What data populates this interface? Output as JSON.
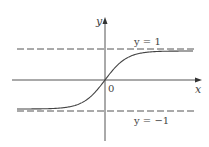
{
  "chart_data": {
    "type": "line",
    "title": "",
    "function": "tanh-like sigmoid",
    "xlabel": "x",
    "ylabel": "y",
    "origin_label": "0",
    "asymptotes": [
      {
        "y": 1,
        "label": "y = 1",
        "style": "dashed"
      },
      {
        "y": -1,
        "label": "y = −1",
        "style": "dashed"
      }
    ],
    "ylim": [
      -1.6,
      1.9
    ],
    "xlim": [
      -3.5,
      3.5
    ],
    "grid": false,
    "legend": null,
    "colors": {
      "axis": "#555555",
      "curve": "#444444",
      "asymptote": "#555555"
    }
  },
  "labels": {
    "x_axis": "x",
    "y_axis": "y",
    "origin": "0",
    "upper_asymptote": "y = 1",
    "lower_asymptote": "y = −1"
  }
}
